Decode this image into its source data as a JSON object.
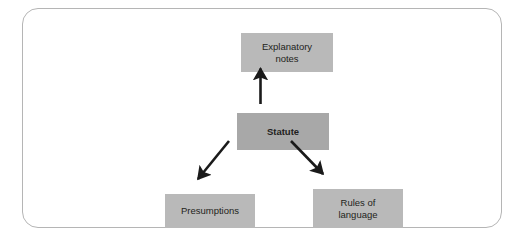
{
  "figure": {
    "frame_border_color": "#b5b5b5",
    "background_color": "#ffffff",
    "caption_fragment": ""
  },
  "diagram": {
    "type": "flow-diagram",
    "node_fill_light": "#b9b9b9",
    "node_fill_dark": "#a8a8a8",
    "connector_color": "#1a1a1a",
    "text_color": "#231f20",
    "nodes": [
      {
        "id": "explanatory-notes",
        "label": "Explanatory\nnotes",
        "emphasis": false
      },
      {
        "id": "statute",
        "label": "Statute",
        "emphasis": true
      },
      {
        "id": "presumptions",
        "label": "Presumptions",
        "emphasis": false
      },
      {
        "id": "rules-of-language",
        "label": "Rules of\nlanguage",
        "emphasis": false
      }
    ],
    "edges": [
      {
        "id": "statute-to-explanatory-notes",
        "from": "statute",
        "to": "explanatory-notes",
        "direction": "up",
        "arrowhead": "target"
      },
      {
        "id": "statute-to-presumptions",
        "from": "statute",
        "to": "presumptions",
        "direction": "down-left",
        "arrowhead": "target"
      },
      {
        "id": "statute-to-rules-of-language",
        "from": "statute",
        "to": "rules-of-language",
        "direction": "down-right",
        "arrowhead": "target"
      }
    ]
  }
}
